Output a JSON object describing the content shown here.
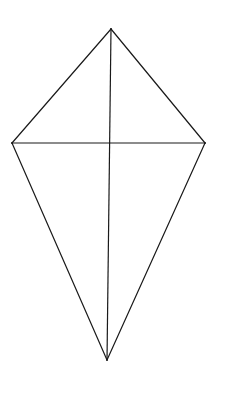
{
  "diagram": {
    "title": "",
    "shape": "kite",
    "vertices": [
      "top",
      "right",
      "bottom",
      "left"
    ],
    "edges": [
      {
        "from": "top",
        "to": "right"
      },
      {
        "from": "right",
        "to": "bottom"
      },
      {
        "from": "bottom",
        "to": "left"
      },
      {
        "from": "left",
        "to": "top"
      }
    ],
    "diagonals": [
      {
        "from": "top",
        "to": "bottom",
        "name": "vertical-diagonal"
      },
      {
        "from": "left",
        "to": "right",
        "name": "horizontal-diagonal"
      }
    ],
    "labels": [],
    "line_color": "#1a1a1a",
    "background": "#ffffff"
  }
}
